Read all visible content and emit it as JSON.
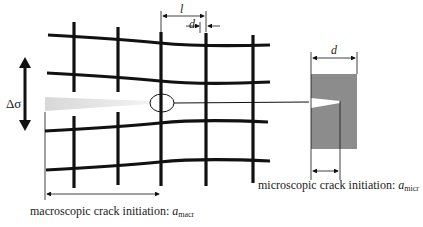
{
  "diagram": {
    "stress_label": "Δσ",
    "grain_spacing_label": "l",
    "grain_boundary_label": "d",
    "detail_width_label": "d",
    "macro_caption": {
      "text": "macroscopic crack initiation: ",
      "symbol": "a",
      "subscript": "macr"
    },
    "micro_caption": {
      "text": "microscopic crack initiation: ",
      "symbol": "a",
      "subscript": "micr"
    },
    "colors": {
      "lines": "#111111",
      "crack_gradient_start": "#dcdcdc",
      "crack_gradient_end": "#f4f4f4",
      "detail_box": "#8c8c8c",
      "background": "#ffffff"
    }
  }
}
